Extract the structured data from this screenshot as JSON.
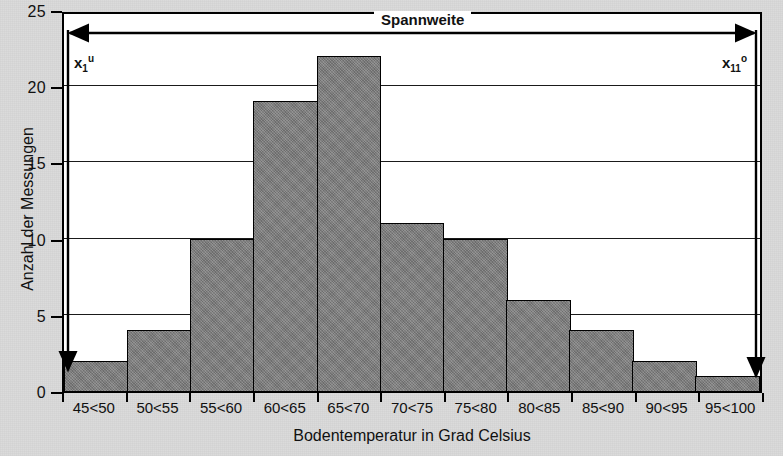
{
  "chart_data": {
    "type": "bar",
    "title": "",
    "xlabel": "Bodentemperatur in Grad Celsius",
    "ylabel": "Anzahl der Messungen",
    "categories": [
      "45<50",
      "50<55",
      "55<60",
      "60<65",
      "65<70",
      "70<75",
      "75<80",
      "80<85",
      "85<90",
      "90<95",
      "95<100"
    ],
    "values": [
      2,
      4,
      10,
      19,
      22,
      11,
      10,
      6,
      4,
      2,
      1
    ],
    "ylim": [
      0,
      25
    ],
    "yticks": [
      0,
      5,
      10,
      15,
      20,
      25
    ],
    "grid": true,
    "legend": "none",
    "bar_color": "#7d7d7d",
    "bar_border_color": "#000000",
    "plot_background": "#ffffff",
    "figure_background": "#d9d9d9",
    "annotations": [
      {
        "name": "span-arrow",
        "label": "Spannweite",
        "kind": "double-headed-horizontal-arrow"
      },
      {
        "name": "lower-bound",
        "label": "x",
        "sub": "1",
        "sup": "u"
      },
      {
        "name": "upper-bound",
        "label": "x",
        "sub": "11",
        "sup": "o"
      }
    ]
  },
  "annotations": {
    "span_label": "Spannweite",
    "lower_bound": {
      "base": "x",
      "sub": "1",
      "sup": "u"
    },
    "upper_bound": {
      "base": "x",
      "sub": "11",
      "sup": "o"
    }
  }
}
